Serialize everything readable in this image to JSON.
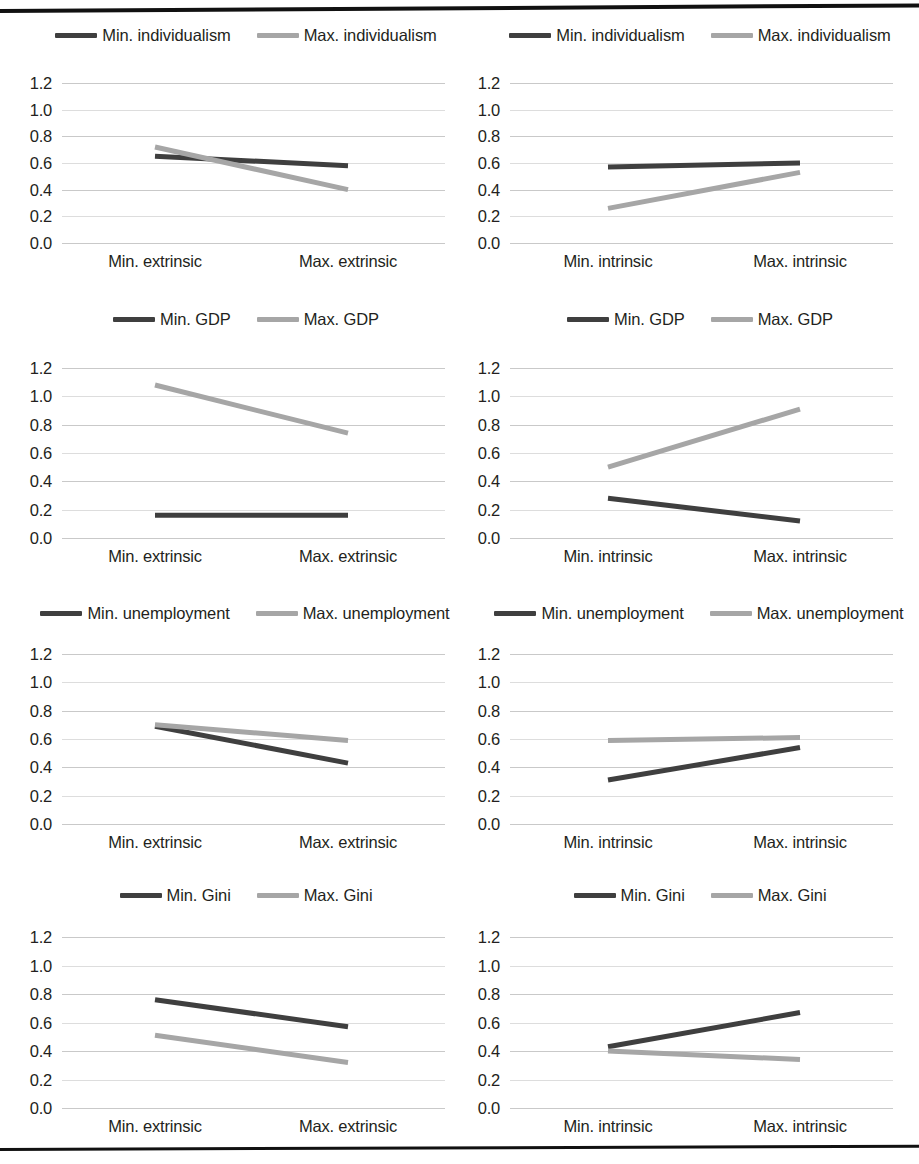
{
  "figure": {
    "ytick_labels": [
      "1.2",
      "1.0",
      "0.8",
      "0.6",
      "0.4",
      "0.2",
      "0.0"
    ],
    "ytick_values": [
      1.2,
      1.0,
      0.8,
      0.6,
      0.4,
      0.2,
      0.0
    ],
    "ylim": [
      0.0,
      1.3
    ],
    "colors": {
      "min_series": "#3f3f3f",
      "max_series": "#a6a6a6",
      "gridline": "#bfbfbf",
      "rule": "#111111"
    },
    "rules": {
      "top": "horizontal-rule",
      "bottom": "horizontal-rule"
    }
  },
  "chart_data": [
    {
      "id": "individualism-extrinsic",
      "type": "line",
      "title": "",
      "xlabel": "",
      "ylabel": "",
      "categories": [
        "Min. extrinsic",
        "Max. extrinsic"
      ],
      "ylim": [
        0.0,
        1.3
      ],
      "grid": true,
      "legend_position": "top-center",
      "series": [
        {
          "name": "Min. individualism",
          "values": [
            0.65,
            0.58
          ],
          "color": "#3f3f3f"
        },
        {
          "name": "Max. individualism",
          "values": [
            0.72,
            0.4
          ],
          "color": "#a6a6a6"
        }
      ]
    },
    {
      "id": "individualism-intrinsic",
      "type": "line",
      "title": "",
      "xlabel": "",
      "ylabel": "",
      "categories": [
        "Min. intrinsic",
        "Max. intrinsic"
      ],
      "ylim": [
        0.0,
        1.3
      ],
      "grid": true,
      "legend_position": "top-center",
      "series": [
        {
          "name": "Min. individualism",
          "values": [
            0.57,
            0.6
          ],
          "color": "#3f3f3f"
        },
        {
          "name": "Max. individualism",
          "values": [
            0.26,
            0.53
          ],
          "color": "#a6a6a6"
        }
      ]
    },
    {
      "id": "gdp-extrinsic",
      "type": "line",
      "title": "",
      "xlabel": "",
      "ylabel": "",
      "categories": [
        "Min. extrinsic",
        "Max. extrinsic"
      ],
      "ylim": [
        0.0,
        1.3
      ],
      "grid": true,
      "legend_position": "top-center",
      "series": [
        {
          "name": "Min. GDP",
          "values": [
            0.16,
            0.16
          ],
          "color": "#3f3f3f"
        },
        {
          "name": "Max. GDP",
          "values": [
            1.08,
            0.74
          ],
          "color": "#a6a6a6"
        }
      ]
    },
    {
      "id": "gdp-intrinsic",
      "type": "line",
      "title": "",
      "xlabel": "",
      "ylabel": "",
      "categories": [
        "Min. intrinsic",
        "Max. intrinsic"
      ],
      "ylim": [
        0.0,
        1.3
      ],
      "grid": true,
      "legend_position": "top-center",
      "series": [
        {
          "name": "Min. GDP",
          "values": [
            0.28,
            0.12
          ],
          "color": "#3f3f3f"
        },
        {
          "name": "Max. GDP",
          "values": [
            0.5,
            0.91
          ],
          "color": "#a6a6a6"
        }
      ]
    },
    {
      "id": "unemployment-extrinsic",
      "type": "line",
      "title": "",
      "xlabel": "",
      "ylabel": "",
      "categories": [
        "Min. extrinsic",
        "Max. extrinsic"
      ],
      "ylim": [
        0.0,
        1.3
      ],
      "grid": true,
      "legend_position": "top-center",
      "series": [
        {
          "name": "Min. unemployment",
          "values": [
            0.69,
            0.43
          ],
          "color": "#3f3f3f"
        },
        {
          "name": "Max. unemployment",
          "values": [
            0.7,
            0.59
          ],
          "color": "#a6a6a6"
        }
      ]
    },
    {
      "id": "unemployment-intrinsic",
      "type": "line",
      "title": "",
      "xlabel": "",
      "ylabel": "",
      "categories": [
        "Min. intrinsic",
        "Max. intrinsic"
      ],
      "ylim": [
        0.0,
        1.3
      ],
      "grid": true,
      "legend_position": "top-center",
      "series": [
        {
          "name": "Min. unemployment",
          "values": [
            0.31,
            0.54
          ],
          "color": "#3f3f3f"
        },
        {
          "name": "Max. unemployment",
          "values": [
            0.59,
            0.61
          ],
          "color": "#a6a6a6"
        }
      ]
    },
    {
      "id": "gini-extrinsic",
      "type": "line",
      "title": "",
      "xlabel": "",
      "ylabel": "",
      "categories": [
        "Min. extrinsic",
        "Max. extrinsic"
      ],
      "ylim": [
        0.0,
        1.3
      ],
      "grid": true,
      "legend_position": "top-center",
      "series": [
        {
          "name": "Min. Gini",
          "values": [
            0.76,
            0.57
          ],
          "color": "#3f3f3f"
        },
        {
          "name": "Max. Gini",
          "values": [
            0.51,
            0.32
          ],
          "color": "#a6a6a6"
        }
      ]
    },
    {
      "id": "gini-intrinsic",
      "type": "line",
      "title": "",
      "xlabel": "",
      "ylabel": "",
      "categories": [
        "Min. intrinsic",
        "Max. intrinsic"
      ],
      "ylim": [
        0.0,
        1.3
      ],
      "grid": true,
      "legend_position": "top-center",
      "series": [
        {
          "name": "Min. Gini",
          "values": [
            0.43,
            0.67
          ],
          "color": "#3f3f3f"
        },
        {
          "name": "Max. Gini",
          "values": [
            0.4,
            0.34
          ],
          "color": "#a6a6a6"
        }
      ]
    }
  ]
}
